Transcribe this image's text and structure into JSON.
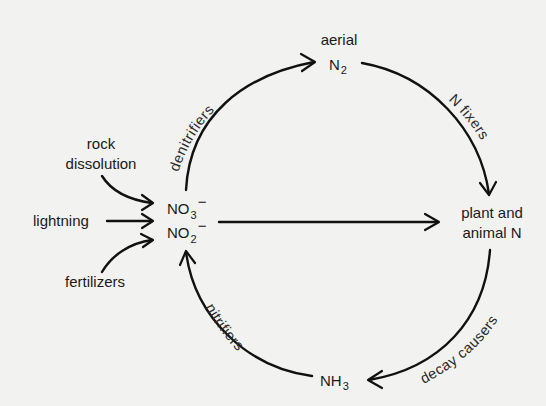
{
  "diagram": {
    "nodes": {
      "aerial_n2": {
        "line1": "aerial",
        "symbol": "N",
        "subscript": "2"
      },
      "plant_animal_n": {
        "line1": "plant and",
        "line2": "animal N"
      },
      "nh3": {
        "symbol": "NH",
        "subscript": "3"
      },
      "nitrates": {
        "no3": {
          "symbol": "NO",
          "subscript": "3",
          "charge": "−"
        },
        "no2": {
          "symbol": "NO",
          "subscript": "2",
          "charge": "−"
        }
      }
    },
    "sources": {
      "rock_dissolution": {
        "line1": "rock",
        "line2": "dissolution"
      },
      "lightning": "lightning",
      "fertilizers": "fertilizers"
    },
    "processes": {
      "denitrifiers": "denitrifiers",
      "n_fixers": "N fixers",
      "decay_causers": "decay causers",
      "nitrifiers": "nitrifiers"
    },
    "colors": {
      "background": "#f2f2f0",
      "ink": "#111111"
    }
  }
}
